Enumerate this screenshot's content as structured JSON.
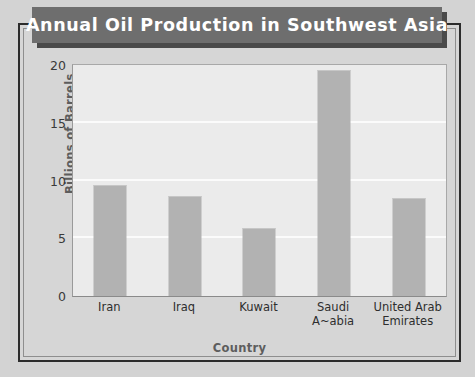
{
  "title": "Annual Oil Production in Southwest Asia",
  "chart_data": {
    "type": "bar",
    "title": "Annual Oil Production in Southwest Asia",
    "xlabel": "Country",
    "ylabel": "Billions of Barrels",
    "categories": [
      "Iran",
      "Iraq",
      "Kuwait",
      "Saudi A~abia",
      "United Arab Emirates"
    ],
    "category_lines": [
      [
        "Iran"
      ],
      [
        "Iraq"
      ],
      [
        "Kuwait"
      ],
      [
        "Saudi",
        "A~abia"
      ],
      [
        "United Arab",
        "Emirates"
      ]
    ],
    "values": [
      9.6,
      8.7,
      5.9,
      19.6,
      8.5
    ],
    "ylim": [
      0,
      20
    ],
    "yticks": [
      0,
      5,
      10,
      15,
      20
    ],
    "ytick_labels": [
      "0",
      "5",
      "10",
      "15",
      "20"
    ],
    "grid": true,
    "legend": false,
    "colors": {
      "bar": "#b2b2b2",
      "plot_background": "#ebebeb",
      "gridline": "#fbfbfb",
      "banner": "#6e6e6e",
      "banner_shadow": "#4a4a4a",
      "title_text": "#ffffff",
      "frame": "#2c2c2c",
      "page_background": "#d3d3d3",
      "axis_title": "#5d5d5d"
    }
  }
}
